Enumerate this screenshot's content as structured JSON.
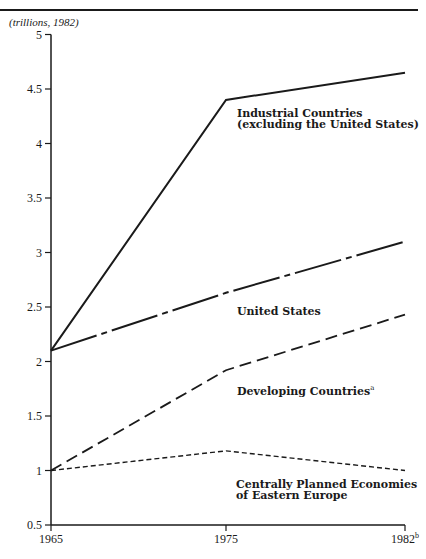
{
  "chart_data": {
    "type": "line",
    "title": "",
    "unit_label": "(trillions, 1982)",
    "xlabel": "",
    "ylabel": "(trillions, 1982)",
    "x": [
      "1965",
      "1975",
      "1982"
    ],
    "x_tick_labels": [
      "1965",
      "1975",
      "1982"
    ],
    "x_tick_superscripts": [
      "",
      "",
      "b"
    ],
    "y_ticks": [
      0.5,
      1,
      1.5,
      2,
      2.5,
      3,
      3.5,
      4,
      4.5,
      5
    ],
    "y_tick_labels": [
      "0.5",
      "1",
      "1.5",
      "2",
      "2.5",
      "3",
      "3.5",
      "4",
      "4.5",
      "5"
    ],
    "ylim": [
      0.5,
      5
    ],
    "grid": false,
    "legend_position": "inline labels",
    "series": [
      {
        "name": "Industrial Countries (excluding the United States)",
        "label_lines": [
          "Industrial Countries",
          "(excluding the United States)"
        ],
        "style": "solid",
        "values": [
          2.1,
          4.4,
          4.65
        ]
      },
      {
        "name": "United States",
        "label_lines": [
          "United States"
        ],
        "style": "dash-dot",
        "values": [
          2.1,
          2.63,
          3.1
        ]
      },
      {
        "name": "Developing Countries",
        "label_lines": [
          "Developing Countries"
        ],
        "label_superscript": "a",
        "style": "dashed",
        "values": [
          1.0,
          1.92,
          2.43
        ]
      },
      {
        "name": "Centrally Planned Economies of Eastern Europe",
        "label_lines": [
          "Centrally Planned Economies",
          "of Eastern Europe"
        ],
        "style": "short-dashed",
        "values": [
          1.0,
          1.18,
          1.0
        ]
      }
    ]
  }
}
